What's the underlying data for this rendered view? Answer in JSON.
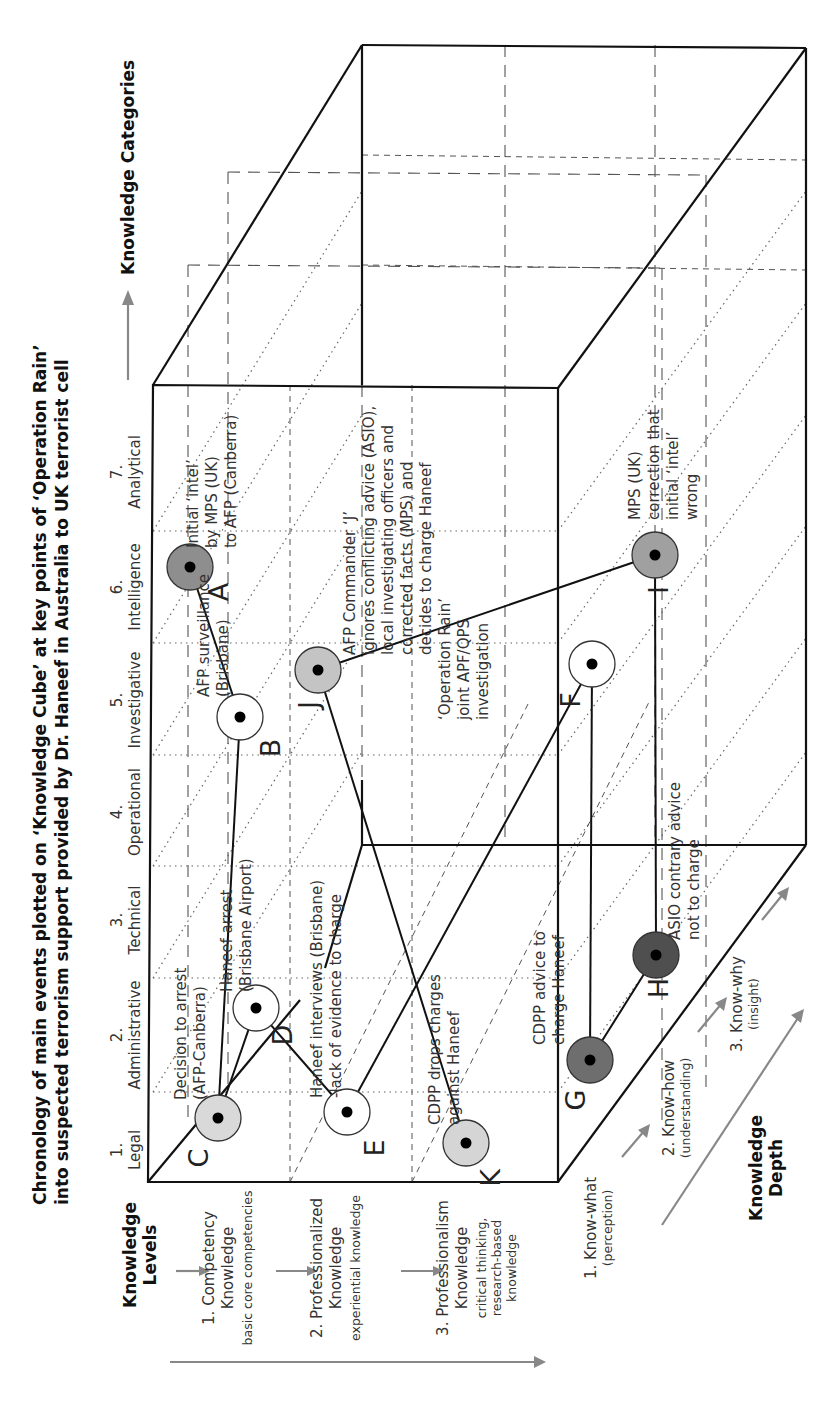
{
  "title": {
    "line1": "Chronology of main events plotted on ‘Knowledge Cube’ at key points of ‘Operation Rain’",
    "line2": "into suspected terrorism support provided by Dr. Haneef in Australia to UK terrorist cell"
  },
  "axes": {
    "categories_title": "Knowledge Categories",
    "levels_title": [
      "Knowledge",
      "Levels"
    ],
    "depth_title": [
      "Knowledge",
      "Depth"
    ]
  },
  "categories": [
    {
      "num": "1.",
      "label": "Legal"
    },
    {
      "num": "2.",
      "label": "Administrative"
    },
    {
      "num": "3.",
      "label": "Technical"
    },
    {
      "num": "4.",
      "label": "Operational"
    },
    {
      "num": "5.",
      "label": "Investigative"
    },
    {
      "num": "6.",
      "label": "Intelligence"
    },
    {
      "num": "7.",
      "label": "Analytical"
    }
  ],
  "levels": [
    {
      "name": [
        "1. Competency",
        "Knowledge"
      ],
      "desc": [
        "basic core competencies"
      ]
    },
    {
      "name": [
        "2. Professionalized",
        "Knowledge"
      ],
      "desc": [
        "experiential knowledge"
      ]
    },
    {
      "name": [
        "3. Professionalism",
        "Knowledge"
      ],
      "desc": [
        "critical thinking,",
        "research-based",
        "knowledge"
      ]
    }
  ],
  "depths": [
    {
      "name": "1. Know-what",
      "desc": "(perception)"
    },
    {
      "name": "2. Know-how",
      "desc": "(understanding)"
    },
    {
      "name": "3. Know-why",
      "desc": "(insight)"
    }
  ],
  "events": [
    {
      "id": "A",
      "letter": "A",
      "text": [
        "Initial ‘intel’",
        "by MPS (UK)",
        "to AFP (Canberra)"
      ],
      "shade": "#8e8e8e"
    },
    {
      "id": "B",
      "letter": "B",
      "text": [
        "AFP surveillance",
        "(Brisbane)"
      ],
      "shade": "#ffffff"
    },
    {
      "id": "C",
      "letter": "C",
      "text": [
        "Decision to arrest",
        "(AFP-Canberra)"
      ],
      "shade": "#d9d9d9"
    },
    {
      "id": "D",
      "letter": "D",
      "text": [
        "Haneef arrest",
        "(Brisbane Airport)"
      ],
      "shade": "#ffffff"
    },
    {
      "id": "E",
      "letter": "E",
      "text": [
        "Haneef  interviews (Brisbane)",
        "-lack of evidence to charge"
      ],
      "shade": "#ffffff"
    },
    {
      "id": "F",
      "letter": "F",
      "text": [
        "‘Operation Rain’",
        "joint APF/QPS",
        "investigation"
      ],
      "shade": "#ffffff"
    },
    {
      "id": "G",
      "letter": "G",
      "text": [
        "CDPP advice to",
        "charge Haneef"
      ],
      "shade": "#6e6e6e"
    },
    {
      "id": "H",
      "letter": "H",
      "text": [
        "ASIO contrary advice",
        "not to charge"
      ],
      "shade": "#4f4f4f"
    },
    {
      "id": "I",
      "letter": "I",
      "text": [
        "MPS (UK)",
        "correction that",
        "initial ‘intel’",
        "wrong"
      ],
      "shade": "#a0a0a0"
    },
    {
      "id": "J",
      "letter": "J",
      "text": [
        "AFP Commander ‘J’",
        "ignores conflicting advice (ASIO),",
        "local investigating officers and",
        "corrected facts (MPS) and",
        "decides to charge Haneef"
      ],
      "shade": "#c4c4c4"
    },
    {
      "id": "K",
      "letter": "K",
      "text": [
        "CDPP drops charges",
        "against Haneef"
      ],
      "shade": "#d5d5d5"
    }
  ],
  "sequence": [
    "A",
    "B",
    "C",
    "D",
    "E",
    "F",
    "G",
    "H",
    "I",
    "J",
    "K"
  ]
}
